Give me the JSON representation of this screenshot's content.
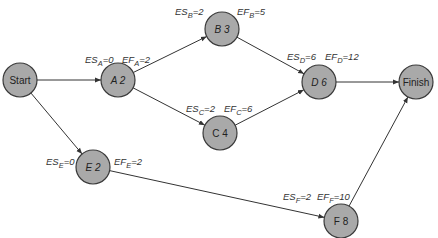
{
  "diagram": {
    "type": "activity-on-node network (CPM forward pass)",
    "colors": {
      "node_fill": "#a9a9a9",
      "node_stroke": "#3a3a3a",
      "edge": "#333333",
      "text": "#222222"
    },
    "nodes": [
      {
        "id": "start",
        "label": "Start",
        "cx": 20,
        "cy": 80,
        "r": 17,
        "italic": false
      },
      {
        "id": "a",
        "label": "A 2",
        "cx": 118,
        "cy": 80,
        "r": 17,
        "italic": true
      },
      {
        "id": "b",
        "label": "B 3",
        "cx": 222,
        "cy": 29,
        "r": 17,
        "italic": true
      },
      {
        "id": "c",
        "label": "C 4",
        "cx": 220,
        "cy": 133,
        "r": 17,
        "italic": false
      },
      {
        "id": "d",
        "label": "D 6",
        "cx": 319,
        "cy": 82,
        "r": 17,
        "italic": true
      },
      {
        "id": "finish",
        "label": "Finish",
        "cx": 416,
        "cy": 82,
        "r": 17,
        "italic": false
      },
      {
        "id": "e",
        "label": "E 2",
        "cx": 93,
        "cy": 167,
        "r": 17,
        "italic": true
      },
      {
        "id": "f",
        "label": "F 8",
        "cx": 341,
        "cy": 221,
        "r": 17,
        "italic": false
      }
    ],
    "edges": [
      {
        "from": "start",
        "to": "a"
      },
      {
        "from": "start",
        "to": "e"
      },
      {
        "from": "a",
        "to": "b"
      },
      {
        "from": "a",
        "to": "c"
      },
      {
        "from": "b",
        "to": "d"
      },
      {
        "from": "c",
        "to": "d"
      },
      {
        "from": "d",
        "to": "finish"
      },
      {
        "from": "e",
        "to": "f"
      },
      {
        "from": "f",
        "to": "finish"
      }
    ],
    "annotations": [
      {
        "id": "es-a",
        "prefix": "ES",
        "sub": "A",
        "value": "=0",
        "x": 85,
        "y": 63
      },
      {
        "id": "ef-a",
        "prefix": "EF",
        "sub": "A",
        "value": "=2",
        "x": 122,
        "y": 63
      },
      {
        "id": "es-b",
        "prefix": "ES",
        "sub": "B",
        "value": "=2",
        "x": 175,
        "y": 15
      },
      {
        "id": "ef-b",
        "prefix": "EF",
        "sub": "B",
        "value": "=5",
        "x": 237,
        "y": 15
      },
      {
        "id": "es-c",
        "prefix": "ES",
        "sub": "C",
        "value": "=2",
        "x": 186,
        "y": 112
      },
      {
        "id": "ef-c",
        "prefix": "EF",
        "sub": "C",
        "value": "=6",
        "x": 224,
        "y": 112
      },
      {
        "id": "es-d",
        "prefix": "ES",
        "sub": "D",
        "value": "=6",
        "x": 287,
        "y": 60
      },
      {
        "id": "ef-d",
        "prefix": "EF",
        "sub": "D",
        "value": "=12",
        "x": 325,
        "y": 60
      },
      {
        "id": "es-e",
        "prefix": "ES",
        "sub": "E",
        "value": "=0",
        "x": 46,
        "y": 165
      },
      {
        "id": "ef-e",
        "prefix": "EF",
        "sub": "E",
        "value": "=2",
        "x": 114,
        "y": 165
      },
      {
        "id": "es-f",
        "prefix": "ES",
        "sub": "F",
        "value": "=2",
        "x": 283,
        "y": 200
      },
      {
        "id": "ef-f",
        "prefix": "EF",
        "sub": "F",
        "value": "=10",
        "x": 317,
        "y": 200
      }
    ]
  }
}
